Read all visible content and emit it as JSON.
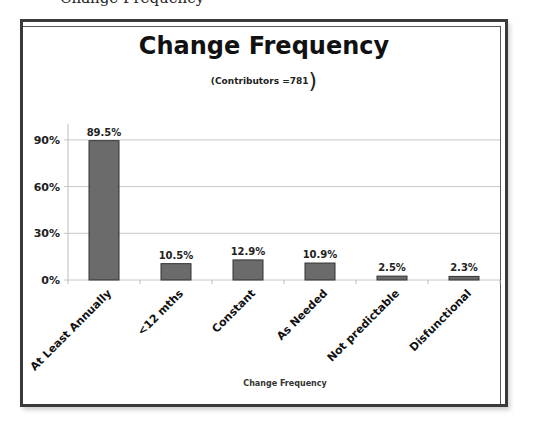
{
  "page": {
    "cropped_caption": "Change Frequency"
  },
  "chart_data": {
    "type": "bar",
    "title": "Change Frequency",
    "subtitle": "(Contributors =781",
    "subtitle_close": ")",
    "categories": [
      "At Least Annually",
      "<12 mths",
      "Constant",
      "As Needed",
      "Not predictable",
      "Disfunctional"
    ],
    "values": [
      89.5,
      10.5,
      12.9,
      10.9,
      2.5,
      2.3
    ],
    "data_labels": [
      "89.5%",
      "10.5%",
      "12.9%",
      "10.9%",
      "2.5%",
      "2.3%"
    ],
    "xlabel": "Change Frequency",
    "ylabel": "",
    "yticks": [
      "0%",
      "30%",
      "60%",
      "90%"
    ],
    "ytick_values": [
      0,
      30,
      60,
      90
    ],
    "ylim": [
      0,
      100
    ],
    "grid": true,
    "legend": null,
    "colors": {
      "bar_fill": "#6b6b6b",
      "bar_stroke": "#333333",
      "grid": "#c8c8c8",
      "frame": "#3a3a3a"
    }
  }
}
